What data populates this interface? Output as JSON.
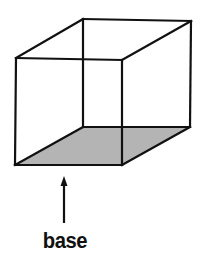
{
  "diagram": {
    "type": "wireframe-cube",
    "label": "base",
    "colors": {
      "stroke": "#111111",
      "base_fill": "#b4b4b4",
      "background": "#ffffff"
    },
    "front_face": {
      "top_left": [
        16,
        58
      ],
      "top_right": [
        122,
        60
      ],
      "bottom_right": [
        122,
        165
      ],
      "bottom_left": [
        15,
        165
      ]
    },
    "back_face": {
      "top_left": [
        83,
        19
      ],
      "top_right": [
        191,
        21
      ],
      "bottom_right": [
        190,
        127
      ],
      "bottom_left": [
        83,
        127
      ]
    },
    "arrow": {
      "from": [
        64,
        223
      ],
      "to": [
        64,
        177
      ]
    }
  }
}
